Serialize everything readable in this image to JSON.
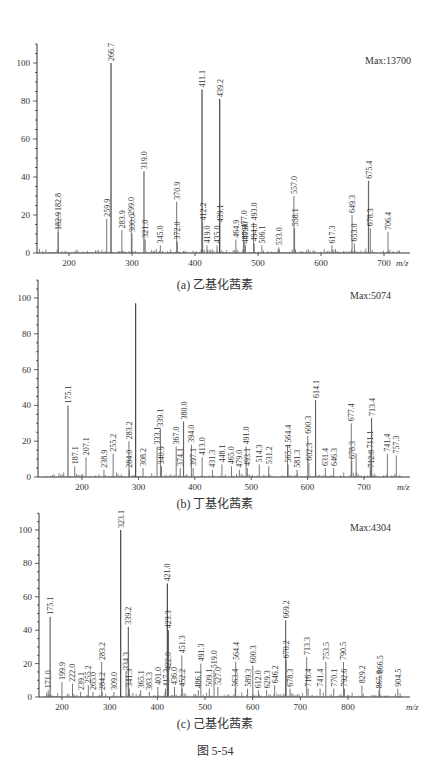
{
  "figure_title": "图 5-54",
  "chart_data": [
    {
      "id": "a",
      "type": "bar",
      "subtype": "mass-spectrum",
      "title": "(a) 乙基化茜素",
      "max_label": "Max:13700",
      "xlabel": "m/z",
      "ylabel": "",
      "xlim": [
        150,
        730
      ],
      "ylim": [
        0,
        110
      ],
      "xticks": [
        200,
        300,
        400,
        500,
        600,
        700
      ],
      "yticks": [
        0,
        20,
        40,
        60,
        80,
        100
      ],
      "grid": false,
      "peaks": [
        {
          "mz": 182.8,
          "i": 21,
          "label": "182.8"
        },
        {
          "mz": 182.9,
          "i": 11,
          "label": "182.9"
        },
        {
          "mz": 259.9,
          "i": 18,
          "label": "259.9"
        },
        {
          "mz": 266.7,
          "i": 100,
          "label": "266.7"
        },
        {
          "mz": 283.9,
          "i": 12,
          "label": "283.9"
        },
        {
          "mz": 300.0,
          "i": 10,
          "label": "300.0"
        },
        {
          "mz": 299.0,
          "i": 19,
          "label": "299.0"
        },
        {
          "mz": 319.0,
          "i": 43,
          "label": "319.0"
        },
        {
          "mz": 321.0,
          "i": 7,
          "label": "321.0"
        },
        {
          "mz": 345.0,
          "i": 4,
          "label": "345.0"
        },
        {
          "mz": 370.9,
          "i": 27,
          "label": "370.9"
        },
        {
          "mz": 372.0,
          "i": 6,
          "label": "372.0"
        },
        {
          "mz": 411.1,
          "i": 86,
          "label": "411.1"
        },
        {
          "mz": 412.2,
          "i": 16,
          "label": "412.2"
        },
        {
          "mz": 419.0,
          "i": 4,
          "label": "419.0"
        },
        {
          "mz": 435.0,
          "i": 4,
          "label": "435.0"
        },
        {
          "mz": 439.1,
          "i": 15,
          "label": "439.1"
        },
        {
          "mz": 439.2,
          "i": 81,
          "label": "439.2"
        },
        {
          "mz": 480.0,
          "i": 4,
          "label": "480.0"
        },
        {
          "mz": 464.9,
          "i": 7,
          "label": "464.9"
        },
        {
          "mz": 477.0,
          "i": 12,
          "label": "477.0"
        },
        {
          "mz": 479.0,
          "i": 6,
          "label": "479.0"
        },
        {
          "mz": 493.0,
          "i": 16,
          "label": "493.0"
        },
        {
          "mz": 494.0,
          "i": 5,
          "label": "494.0"
        },
        {
          "mz": 506.1,
          "i": 4,
          "label": "506.1"
        },
        {
          "mz": 533.0,
          "i": 3,
          "label": "533.0"
        },
        {
          "mz": 557.0,
          "i": 30,
          "label": "557.0"
        },
        {
          "mz": 558.1,
          "i": 13,
          "label": "558.1"
        },
        {
          "mz": 617.3,
          "i": 4,
          "label": "617.3"
        },
        {
          "mz": 649.3,
          "i": 20,
          "label": "649.3"
        },
        {
          "mz": 653.0,
          "i": 5,
          "label": "653.0"
        },
        {
          "mz": 675.4,
          "i": 38,
          "label": "675.4"
        },
        {
          "mz": 678.3,
          "i": 13,
          "label": "678.3"
        },
        {
          "mz": 706.4,
          "i": 11,
          "label": "706.4"
        }
      ]
    },
    {
      "id": "b",
      "type": "bar",
      "subtype": "mass-spectrum",
      "title": "(b) 丁基化茜素",
      "max_label": "Max:5074",
      "xlabel": "m/z",
      "ylabel": "",
      "xlim": [
        130,
        770
      ],
      "ylim": [
        0,
        110
      ],
      "xticks": [
        200,
        300,
        400,
        500,
        600,
        700
      ],
      "yticks": [
        0,
        20,
        40,
        60,
        80,
        100
      ],
      "grid": false,
      "peaks": [
        {
          "mz": 175.1,
          "i": 40,
          "label": "175.1"
        },
        {
          "mz": 187.1,
          "i": 6,
          "label": "187.1"
        },
        {
          "mz": 207.1,
          "i": 11,
          "label": "207.1"
        },
        {
          "mz": 238.9,
          "i": 4,
          "label": "238.9"
        },
        {
          "mz": 255.2,
          "i": 13,
          "label": "255.2"
        },
        {
          "mz": 283.2,
          "i": 20,
          "label": "283.2"
        },
        {
          "mz": 284.0,
          "i": 4,
          "label": "284.0"
        },
        {
          "mz": 295.1,
          "i": 97,
          "label": ""
        },
        {
          "mz": 308.2,
          "i": 5,
          "label": "308.2"
        },
        {
          "mz": 333.1,
          "i": 17,
          "label": "333.1"
        },
        {
          "mz": 339.1,
          "i": 27,
          "label": "339.1"
        },
        {
          "mz": 340.9,
          "i": 6,
          "label": "340.9"
        },
        {
          "mz": 367.0,
          "i": 17,
          "label": "367.0"
        },
        {
          "mz": 374.1,
          "i": 5,
          "label": "374.1"
        },
        {
          "mz": 380.0,
          "i": 31,
          "label": "380.0"
        },
        {
          "mz": 394.0,
          "i": 18,
          "label": "394.0"
        },
        {
          "mz": 397.1,
          "i": 5,
          "label": "397.1"
        },
        {
          "mz": 413.0,
          "i": 11,
          "label": "413.0"
        },
        {
          "mz": 431.3,
          "i": 4,
          "label": "431.3"
        },
        {
          "mz": 448.1,
          "i": 7,
          "label": "448.1"
        },
        {
          "mz": 465.0,
          "i": 6,
          "label": "465.0"
        },
        {
          "mz": 479.0,
          "i": 4,
          "label": "479.0"
        },
        {
          "mz": 491.0,
          "i": 17,
          "label": "491.0"
        },
        {
          "mz": 493.1,
          "i": 5,
          "label": "493.1"
        },
        {
          "mz": 514.3,
          "i": 7,
          "label": "514.3"
        },
        {
          "mz": 531.2,
          "i": 6,
          "label": "531.2"
        },
        {
          "mz": 565.4,
          "i": 7,
          "label": "565.4"
        },
        {
          "mz": 564.4,
          "i": 18,
          "label": "564.4"
        },
        {
          "mz": 581.3,
          "i": 4,
          "label": "581.3"
        },
        {
          "mz": 600.3,
          "i": 23,
          "label": "600.3"
        },
        {
          "mz": 602.3,
          "i": 8,
          "label": "602.3"
        },
        {
          "mz": 614.1,
          "i": 43,
          "label": "614.1"
        },
        {
          "mz": 631.4,
          "i": 5,
          "label": "631.4"
        },
        {
          "mz": 646.3,
          "i": 5,
          "label": "646.3"
        },
        {
          "mz": 678.3,
          "i": 9,
          "label": "678.3"
        },
        {
          "mz": 677.4,
          "i": 30,
          "label": "677.4"
        },
        {
          "mz": 686.0,
          "i": 13,
          "label": ""
        },
        {
          "mz": 712.0,
          "i": 4,
          "label": "712.0"
        },
        {
          "mz": 711.1,
          "i": 15,
          "label": "711.1"
        },
        {
          "mz": 713.4,
          "i": 33,
          "label": "713.4"
        },
        {
          "mz": 741.4,
          "i": 13,
          "label": "741.4"
        },
        {
          "mz": 757.3,
          "i": 12,
          "label": "757.3"
        }
      ]
    },
    {
      "id": "c",
      "type": "bar",
      "subtype": "mass-spectrum",
      "title": "(c) 己基化茜素",
      "max_label": "Max:4304",
      "xlabel": "m/z",
      "ylabel": "",
      "xlim": [
        160,
        920
      ],
      "ylim": [
        0,
        110
      ],
      "xticks": [
        200,
        300,
        400,
        500,
        600,
        700,
        800
      ],
      "yticks": [
        0,
        20,
        40,
        60,
        80,
        100
      ],
      "grid": false,
      "peaks": [
        {
          "mz": 171.0,
          "i": 4,
          "label": "171.0"
        },
        {
          "mz": 175.1,
          "i": 48,
          "label": "175.1"
        },
        {
          "mz": 199.9,
          "i": 9,
          "label": "199.9"
        },
        {
          "mz": 222.0,
          "i": 8,
          "label": "222.0"
        },
        {
          "mz": 239.1,
          "i": 3,
          "label": "239.1"
        },
        {
          "mz": 255.2,
          "i": 7,
          "label": "255.2"
        },
        {
          "mz": 265.0,
          "i": 3,
          "label": "265.0"
        },
        {
          "mz": 283.2,
          "i": 21,
          "label": "283.2"
        },
        {
          "mz": 284.2,
          "i": 3,
          "label": "284.2"
        },
        {
          "mz": 309.0,
          "i": 3,
          "label": "309.0"
        },
        {
          "mz": 323.1,
          "i": 100,
          "label": "323.1"
        },
        {
          "mz": 334.3,
          "i": 15,
          "label": "334.3"
        },
        {
          "mz": 339.2,
          "i": 42,
          "label": "339.2"
        },
        {
          "mz": 341.3,
          "i": 5,
          "label": "341.3"
        },
        {
          "mz": 365.1,
          "i": 4,
          "label": "365.1"
        },
        {
          "mz": 383.3,
          "i": 3,
          "label": "383.3"
        },
        {
          "mz": 401.0,
          "i": 6,
          "label": "401.0"
        },
        {
          "mz": 417.3,
          "i": 5,
          "label": "417.3"
        },
        {
          "mz": 421.0,
          "i": 68,
          "label": "421.0"
        },
        {
          "mz": 422.0,
          "i": 15,
          "label": "422.0"
        },
        {
          "mz": 423.3,
          "i": 40,
          "label": "423.3"
        },
        {
          "mz": 436.0,
          "i": 6,
          "label": "436.0"
        },
        {
          "mz": 451.3,
          "i": 25,
          "label": "451.3"
        },
        {
          "mz": 452.2,
          "i": 5,
          "label": "452.2"
        },
        {
          "mz": 486.1,
          "i": 4,
          "label": "486.1"
        },
        {
          "mz": 491.3,
          "i": 20,
          "label": "491.3"
        },
        {
          "mz": 509.1,
          "i": 5,
          "label": "509.1"
        },
        {
          "mz": 519.0,
          "i": 16,
          "label": "519.0"
        },
        {
          "mz": 527.0,
          "i": 6,
          "label": "527.0"
        },
        {
          "mz": 563.4,
          "i": 5,
          "label": "563.4"
        },
        {
          "mz": 564.4,
          "i": 21,
          "label": "564.4"
        },
        {
          "mz": 589.3,
          "i": 5,
          "label": "589.3"
        },
        {
          "mz": 600.3,
          "i": 19,
          "label": "600.3"
        },
        {
          "mz": 612.0,
          "i": 4,
          "label": "612.0"
        },
        {
          "mz": 629.3,
          "i": 4,
          "label": "629.3"
        },
        {
          "mz": 646.2,
          "i": 7,
          "label": "646.2"
        },
        {
          "mz": 669.2,
          "i": 46,
          "label": "669.2"
        },
        {
          "mz": 670.2,
          "i": 22,
          "label": "670.2"
        },
        {
          "mz": 678.3,
          "i": 5,
          "label": "678.3"
        },
        {
          "mz": 713.3,
          "i": 24,
          "label": "713.3"
        },
        {
          "mz": 716.4,
          "i": 5,
          "label": "716.4"
        },
        {
          "mz": 741.4,
          "i": 5,
          "label": "741.4"
        },
        {
          "mz": 753.5,
          "i": 21,
          "label": "753.5"
        },
        {
          "mz": 770.1,
          "i": 5,
          "label": "770.1"
        },
        {
          "mz": 790.5,
          "i": 21,
          "label": "790.5"
        },
        {
          "mz": 792.6,
          "i": 5,
          "label": "792.6"
        },
        {
          "mz": 829.2,
          "i": 7,
          "label": "829.2"
        },
        {
          "mz": 865.0,
          "i": 4,
          "label": "865.0"
        },
        {
          "mz": 866.5,
          "i": 13,
          "label": "866.5"
        },
        {
          "mz": 904.5,
          "i": 5,
          "label": "904.5"
        }
      ]
    }
  ]
}
